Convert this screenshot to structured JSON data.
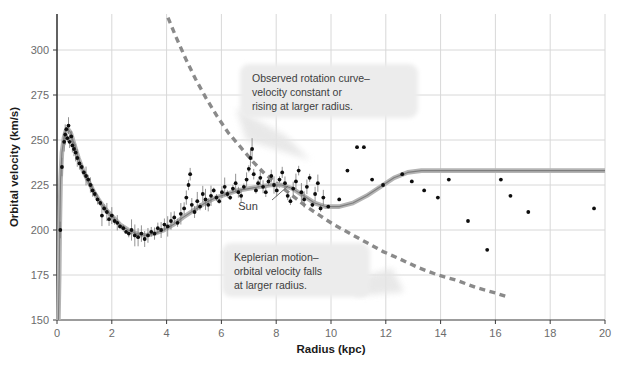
{
  "chart_data": {
    "type": "scatter",
    "title": "",
    "xlabel": "Radius (kpc)",
    "ylabel": "Orbital velocity (km/s)",
    "xlim": [
      0,
      20
    ],
    "ylim": [
      150,
      320
    ],
    "xticks": [
      0,
      2,
      4,
      6,
      8,
      10,
      12,
      14,
      16,
      18,
      20
    ],
    "xticklabels": [
      "0",
      "2",
      "4",
      "6",
      "8",
      "10",
      "12",
      "14",
      "16",
      "18",
      "20"
    ],
    "yticks": [
      150,
      175,
      200,
      225,
      250,
      275,
      300
    ],
    "yticklabels": [
      "150",
      "175",
      "200",
      "225",
      "250",
      "275",
      "300"
    ],
    "grid": true,
    "legend": "none",
    "series": [
      {
        "name": "observed-rotation-curve-model",
        "type": "line",
        "style": "solid",
        "color": "#9a9a9a",
        "points": [
          [
            0.05,
            150
          ],
          [
            0.08,
            175
          ],
          [
            0.1,
            200
          ],
          [
            0.13,
            228
          ],
          [
            0.18,
            243
          ],
          [
            0.25,
            251
          ],
          [
            0.32,
            255
          ],
          [
            0.4,
            256
          ],
          [
            0.5,
            254
          ],
          [
            0.62,
            248
          ],
          [
            0.78,
            240
          ],
          [
            0.95,
            233
          ],
          [
            1.15,
            227
          ],
          [
            1.35,
            221
          ],
          [
            1.55,
            216
          ],
          [
            1.8,
            211
          ],
          [
            2.05,
            207
          ],
          [
            2.3,
            203
          ],
          [
            2.6,
            200
          ],
          [
            2.9,
            198
          ],
          [
            3.2,
            197
          ],
          [
            3.55,
            198
          ],
          [
            3.9,
            200
          ],
          [
            4.25,
            203
          ],
          [
            4.6,
            207
          ],
          [
            5.0,
            211
          ],
          [
            5.4,
            215
          ],
          [
            5.8,
            218
          ],
          [
            6.2,
            220
          ],
          [
            6.6,
            222
          ],
          [
            7.0,
            223
          ],
          [
            7.4,
            224
          ],
          [
            7.8,
            225
          ],
          [
            8.2,
            225
          ],
          [
            8.6,
            223
          ],
          [
            9.0,
            219
          ],
          [
            9.4,
            215
          ],
          [
            9.8,
            213
          ],
          [
            10.3,
            213
          ],
          [
            10.8,
            215
          ],
          [
            11.3,
            219
          ],
          [
            11.8,
            224
          ],
          [
            12.3,
            229
          ],
          [
            12.8,
            232
          ],
          [
            13.3,
            233
          ],
          [
            14.0,
            233
          ],
          [
            15.0,
            233
          ],
          [
            16.0,
            233
          ],
          [
            17.0,
            233
          ],
          [
            18.0,
            233
          ],
          [
            19.0,
            233
          ],
          [
            20.0,
            233
          ]
        ]
      },
      {
        "name": "keplerian-motion-curve",
        "type": "line",
        "style": "dashed",
        "color": "#8a8a8a",
        "points": [
          [
            4.05,
            318
          ],
          [
            4.35,
            307
          ],
          [
            4.7,
            295
          ],
          [
            5.05,
            284
          ],
          [
            5.45,
            273
          ],
          [
            5.85,
            263
          ],
          [
            6.25,
            254
          ],
          [
            6.7,
            246
          ],
          [
            7.15,
            238
          ],
          [
            7.6,
            231
          ],
          [
            8.1,
            225
          ],
          [
            8.6,
            219
          ],
          [
            9.1,
            213
          ],
          [
            9.6,
            208
          ],
          [
            10.1,
            203
          ],
          [
            10.7,
            198
          ],
          [
            11.3,
            193
          ],
          [
            11.9,
            188
          ],
          [
            12.5,
            184
          ],
          [
            13.2,
            179
          ],
          [
            13.9,
            175
          ],
          [
            14.6,
            172
          ],
          [
            15.3,
            168
          ],
          [
            16.0,
            165
          ],
          [
            16.4,
            163
          ]
        ]
      },
      {
        "name": "observed-data-points-inner",
        "type": "scatter",
        "color": "#0d0d0d",
        "points": [
          [
            0.12,
            200
          ],
          [
            0.18,
            235
          ],
          [
            0.26,
            249
          ],
          [
            0.3,
            253
          ],
          [
            0.34,
            256
          ],
          [
            0.38,
            251
          ],
          [
            0.42,
            258
          ],
          [
            0.46,
            249
          ],
          [
            0.52,
            252
          ],
          [
            0.56,
            247
          ],
          [
            0.62,
            245
          ],
          [
            0.68,
            243
          ],
          [
            0.74,
            240
          ],
          [
            0.82,
            237
          ],
          [
            0.9,
            235
          ],
          [
            0.98,
            232
          ],
          [
            1.06,
            230
          ],
          [
            1.14,
            228
          ],
          [
            1.22,
            225
          ],
          [
            1.3,
            222
          ],
          [
            1.38,
            220
          ],
          [
            1.48,
            217
          ],
          [
            1.58,
            215
          ],
          [
            1.64,
            208
          ],
          [
            1.72,
            212
          ],
          [
            1.82,
            210
          ],
          [
            1.9,
            206
          ],
          [
            2.0,
            208
          ],
          [
            2.1,
            205
          ],
          [
            2.2,
            204
          ],
          [
            2.3,
            202
          ],
          [
            2.42,
            201
          ],
          [
            2.52,
            199
          ],
          [
            2.62,
            198
          ],
          [
            2.72,
            200
          ],
          [
            2.84,
            197
          ],
          [
            2.96,
            196
          ],
          [
            3.08,
            198
          ],
          [
            3.2,
            195
          ],
          [
            3.32,
            197
          ],
          [
            3.44,
            199
          ],
          [
            3.56,
            198
          ],
          [
            3.68,
            201
          ],
          [
            3.8,
            200
          ],
          [
            3.92,
            203
          ],
          [
            4.04,
            202
          ],
          [
            4.16,
            205
          ],
          [
            4.28,
            207
          ],
          [
            4.4,
            204
          ],
          [
            4.52,
            209
          ],
          [
            4.64,
            212
          ],
          [
            4.72,
            218
          ],
          [
            4.8,
            225
          ],
          [
            4.86,
            231
          ],
          [
            4.92,
            214
          ],
          [
            5.02,
            210
          ],
          [
            5.12,
            216
          ],
          [
            5.22,
            213
          ],
          [
            5.32,
            220
          ],
          [
            5.42,
            217
          ],
          [
            5.52,
            214
          ],
          [
            5.62,
            219
          ],
          [
            5.72,
            222
          ],
          [
            5.82,
            218
          ],
          [
            5.92,
            216
          ],
          [
            6.02,
            221
          ],
          [
            6.12,
            224
          ],
          [
            6.22,
            220
          ],
          [
            6.32,
            218
          ],
          [
            6.42,
            223
          ],
          [
            6.52,
            226
          ],
          [
            6.62,
            221
          ],
          [
            6.72,
            219
          ],
          [
            6.82,
            224
          ],
          [
            6.92,
            228
          ],
          [
            7.0,
            234
          ],
          [
            7.06,
            240
          ],
          [
            7.12,
            245
          ],
          [
            7.18,
            231
          ],
          [
            7.26,
            222
          ],
          [
            7.34,
            226
          ],
          [
            7.42,
            229
          ],
          [
            7.52,
            224
          ],
          [
            7.62,
            221
          ],
          [
            7.72,
            227
          ],
          [
            7.82,
            230
          ],
          [
            7.92,
            225
          ],
          [
            8.02,
            222
          ],
          [
            8.12,
            228
          ],
          [
            8.22,
            232
          ],
          [
            8.32,
            226
          ],
          [
            8.42,
            219
          ],
          [
            8.52,
            216
          ],
          [
            8.62,
            223
          ],
          [
            8.72,
            227
          ],
          [
            8.82,
            233
          ],
          [
            8.92,
            221
          ],
          [
            9.02,
            217
          ],
          [
            9.12,
            224
          ],
          [
            9.22,
            229
          ],
          [
            9.32,
            214
          ],
          [
            9.42,
            220
          ],
          [
            9.52,
            226
          ],
          [
            9.62,
            212
          ],
          [
            9.72,
            218
          ]
        ]
      },
      {
        "name": "observed-data-points-outer",
        "type": "scatter",
        "color": "#0d0d0d",
        "points": [
          [
            9.9,
            213
          ],
          [
            10.3,
            217
          ],
          [
            10.95,
            246
          ],
          [
            11.2,
            246
          ],
          [
            11.5,
            228
          ],
          [
            11.9,
            225
          ],
          [
            12.6,
            231
          ],
          [
            12.95,
            227
          ],
          [
            13.4,
            222
          ],
          [
            13.9,
            218
          ],
          [
            14.3,
            228
          ],
          [
            15.0,
            205
          ],
          [
            15.7,
            189
          ],
          [
            16.2,
            228
          ],
          [
            16.55,
            219
          ],
          [
            17.2,
            210
          ],
          [
            19.6,
            212
          ],
          [
            10.6,
            233
          ]
        ]
      }
    ],
    "annotations": [
      {
        "name": "observed-rotation-annotation",
        "lines": [
          "Observed rotation curve–",
          "velocity constant or",
          "rising at larger radius."
        ]
      },
      {
        "name": "keplerian-annotation",
        "lines": [
          "Keplerian motion–",
          "orbital velocity falls",
          "at larger radius."
        ]
      },
      {
        "name": "sun-marker-label",
        "lines": [
          "Sun"
        ]
      }
    ]
  },
  "style": {
    "background": "#ffffff",
    "grid_color": "#d8d8d8",
    "axis_color": "#3a3a3a",
    "curve_color": "#9a9a9a",
    "dashed_color": "#8a8a8a",
    "point_color": "#0d0d0d",
    "callout_bg": "#ececec",
    "text_color": "#3d3d3d"
  }
}
